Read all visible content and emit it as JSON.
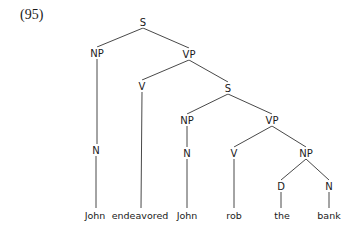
{
  "example_number": "(95)",
  "tree": {
    "nodes": {
      "s1": {
        "label": "S",
        "x": 143,
        "y": 22
      },
      "np1": {
        "label": "NP",
        "x": 97,
        "y": 53
      },
      "vp1": {
        "label": "VP",
        "x": 189,
        "y": 54
      },
      "n1": {
        "label": "N",
        "x": 96,
        "y": 150
      },
      "v1": {
        "label": "V",
        "x": 142,
        "y": 86
      },
      "s2": {
        "label": "S",
        "x": 228,
        "y": 88
      },
      "np2": {
        "label": "NP",
        "x": 187,
        "y": 120
      },
      "vp2": {
        "label": "VP",
        "x": 272,
        "y": 120
      },
      "n2": {
        "label": "N",
        "x": 187,
        "y": 153
      },
      "v2": {
        "label": "V",
        "x": 234,
        "y": 153
      },
      "np3": {
        "label": "NP",
        "x": 306,
        "y": 153
      },
      "d1": {
        "label": "D",
        "x": 281,
        "y": 186
      },
      "n3": {
        "label": "N",
        "x": 329,
        "y": 186
      }
    },
    "words": [
      {
        "text": "John",
        "x": 95,
        "y": 215,
        "parent": "n1"
      },
      {
        "text": "endeavored",
        "x": 140,
        "y": 215,
        "parent": "v1"
      },
      {
        "text": "John",
        "x": 187,
        "y": 215,
        "parent": "n2"
      },
      {
        "text": "rob",
        "x": 234,
        "y": 215,
        "parent": "v2"
      },
      {
        "text": "the",
        "x": 282,
        "y": 215,
        "parent": "d1"
      },
      {
        "text": "bank",
        "x": 329,
        "y": 215,
        "parent": "n3"
      }
    ],
    "edges": [
      [
        "s1",
        "np1"
      ],
      [
        "s1",
        "vp1"
      ],
      [
        "np1",
        "n1"
      ],
      [
        "vp1",
        "v1"
      ],
      [
        "vp1",
        "s2"
      ],
      [
        "s2",
        "np2"
      ],
      [
        "s2",
        "vp2"
      ],
      [
        "np2",
        "n2"
      ],
      [
        "vp2",
        "v2"
      ],
      [
        "vp2",
        "np3"
      ],
      [
        "np3",
        "d1"
      ],
      [
        "np3",
        "n3"
      ]
    ]
  }
}
